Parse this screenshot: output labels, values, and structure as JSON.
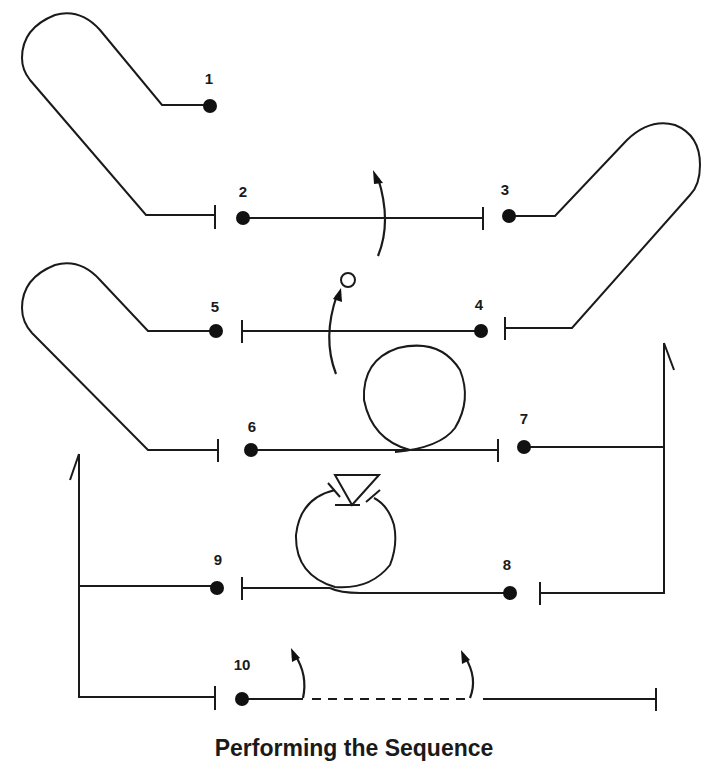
{
  "title": "Performing the Sequence",
  "colors": {
    "line": "#1a1a1a",
    "background": "#ffffff"
  },
  "positions": [
    {
      "number": "1",
      "label_x": 209,
      "label_y": 71
    },
    {
      "number": "2",
      "label_x": 243,
      "label_y": 184
    },
    {
      "number": "3",
      "label_x": 505,
      "label_y": 182
    },
    {
      "number": "4",
      "label_x": 479,
      "label_y": 297
    },
    {
      "number": "5",
      "label_x": 215,
      "label_y": 299
    },
    {
      "number": "6",
      "label_x": 252,
      "label_y": 419
    },
    {
      "number": "7",
      "label_x": 524,
      "label_y": 411
    },
    {
      "number": "8",
      "label_x": 507,
      "label_y": 557
    },
    {
      "number": "9",
      "label_x": 218,
      "label_y": 552
    },
    {
      "number": "10",
      "label_x": 242,
      "label_y": 657
    }
  ]
}
